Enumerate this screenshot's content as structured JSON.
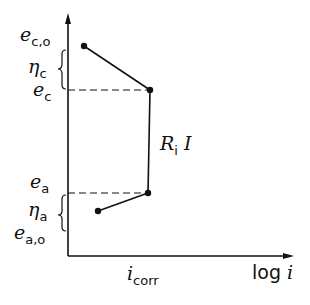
{
  "diagram": {
    "type": "polarization-diagram",
    "axes": {
      "x_label": "log i",
      "x_label_parts": {
        "func": "log",
        "var": "i"
      }
    },
    "labels": {
      "ec0": {
        "main": "e",
        "sub": "c,o"
      },
      "eta_c": {
        "main": "η",
        "sub": "c"
      },
      "ec": {
        "main": "e",
        "sub": "c"
      },
      "ea": {
        "main": "e",
        "sub": "a"
      },
      "eta_a": {
        "main": "η",
        "sub": "a"
      },
      "ea0": {
        "main": "e",
        "sub": "a,o"
      },
      "icorr": {
        "main": "i",
        "sub": "corr"
      },
      "ri": {
        "main": "R",
        "sub": "i",
        "tail": "I"
      }
    },
    "points": [
      {
        "name": "e_c,o",
        "x": 84,
        "y": 46
      },
      {
        "name": "e_c",
        "x": 150,
        "y": 90
      },
      {
        "name": "e_a",
        "x": 148,
        "y": 193
      },
      {
        "name": "e_a,o",
        "x": 98,
        "y": 211
      }
    ],
    "colors": {
      "ink": "#111111",
      "background": "#ffffff"
    }
  }
}
